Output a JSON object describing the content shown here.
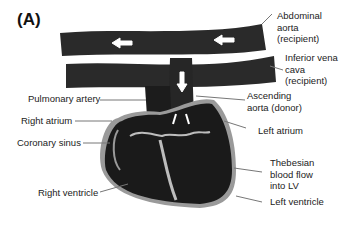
{
  "panel_label": "(A)",
  "labels": {
    "abdominal_aorta": "Abdominal\naorta\n(recipient)",
    "inferior_vena_cava": "Inferior vena\ncava\n(recipient)",
    "ascending_aorta": "Ascending\naorta (donor)",
    "pulmonary_artery": "Pulmonary artery",
    "right_atrium": "Right atrium",
    "coronary_sinus": "Coronary sinus",
    "left_atrium": "Left atrium",
    "thebesian_flow": "Thebesian\nblood flow\ninto LV",
    "right_ventricle": "Right ventricle",
    "left_ventricle": "Left ventricle"
  },
  "colors": {
    "vessel": "#2a2a2a",
    "heart": "#1e1e1e",
    "outline": "#9a9a9a",
    "arrow": "#ffffff",
    "leader": "#777777"
  }
}
